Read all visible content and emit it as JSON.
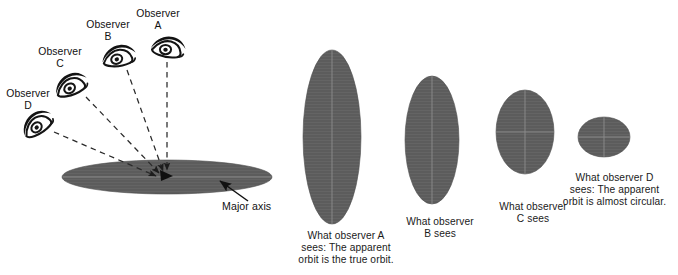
{
  "figure": {
    "background_color": "#ffffff",
    "ellipse_fill": "#5c5c5c",
    "ellipse_line_color": "#8c8c8c",
    "text_color": "#111111",
    "dash_color": "#303030"
  },
  "left_panel": {
    "observers": [
      {
        "id": "A",
        "label": "Observer\nA",
        "label_x": 143,
        "label_y": 10,
        "eye_x": 168,
        "eye_y": 46,
        "eye_rotation": 0,
        "sight_line": {
          "x1": 167,
          "y1": 62,
          "x2": 167,
          "y2": 172
        }
      },
      {
        "id": "B",
        "label": "Observer\nB",
        "label_x": 91,
        "label_y": 19,
        "eye_x": 118,
        "eye_y": 55,
        "eye_rotation": -18,
        "sight_line": {
          "x1": 127,
          "y1": 70,
          "x2": 164,
          "y2": 172
        }
      },
      {
        "id": "C",
        "label": "Observer\nC",
        "label_x": 42,
        "label_y": 46,
        "eye_x": 70,
        "eye_y": 84,
        "eye_rotation": -30,
        "sight_line": {
          "x1": 84,
          "y1": 96,
          "x2": 161,
          "y2": 174
        }
      },
      {
        "id": "D",
        "label": "Observer\nD",
        "label_x": 5,
        "label_y": 88,
        "eye_x": 36,
        "eye_y": 123,
        "eye_rotation": -42,
        "sight_line": {
          "x1": 52,
          "y1": 131,
          "x2": 159,
          "y2": 177
        }
      }
    ],
    "true_orbit": {
      "center_x": 167,
      "center_y": 177,
      "rx": 105,
      "ry": 17,
      "major_axis_line": true
    },
    "major_axis": {
      "label": "Major axis",
      "label_x": 222,
      "label_y": 205,
      "arrow": {
        "x1": 248,
        "y1": 201,
        "x2": 219,
        "y2": 180
      }
    },
    "convergence_marker": {
      "x": 166,
      "y": 175
    }
  },
  "apparent_orbits": [
    {
      "observer": "A",
      "caption": "What observer A\nsees:  The apparent\norbit is the true orbit.",
      "caption_x": 282,
      "caption_y": 230,
      "caption_width": 128,
      "center_x": 332,
      "center_y": 137,
      "rx": 29,
      "ry": 87,
      "vertical_line": true,
      "horizontal_line": false
    },
    {
      "observer": "B",
      "caption": "What observer\nB sees",
      "caption_x": 385,
      "caption_y": 218,
      "caption_width": 110,
      "center_x": 432,
      "center_y": 140,
      "rx": 27,
      "ry": 64,
      "vertical_line": true,
      "horizontal_line": false
    },
    {
      "observer": "C",
      "caption": "What observer\nC sees",
      "caption_x": 478,
      "caption_y": 203,
      "caption_width": 110,
      "center_x": 525,
      "center_y": 132,
      "rx": 29,
      "ry": 42,
      "vertical_line": true,
      "horizontal_line": true
    },
    {
      "observer": "D",
      "caption": "What observer D\nsees:  The apparent\norbit is almost circular.",
      "caption_x": 552,
      "caption_y": 174,
      "caption_width": 126,
      "center_x": 604,
      "center_y": 137,
      "rx": 26,
      "ry": 20,
      "vertical_line": true,
      "horizontal_line": true
    }
  ]
}
